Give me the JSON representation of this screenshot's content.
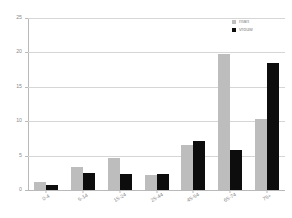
{
  "chart_data": {
    "type": "bar",
    "title": "",
    "subtitle": "",
    "xlabel": "",
    "ylabel": "",
    "categories": [
      "0-4",
      "5-14",
      "15-24",
      "25-44",
      "45-54",
      "65-74",
      "75+"
    ],
    "series": [
      {
        "name": "man",
        "color": "#bdbdbd",
        "values": [
          1.2,
          3.4,
          4.6,
          2.2,
          6.5,
          19.8,
          10.3
        ]
      },
      {
        "name": "vrouw",
        "color": "#0d0d0d",
        "values": [
          0.8,
          2.5,
          2.3,
          2.4,
          7.1,
          5.8,
          18.4
        ]
      }
    ],
    "ylim": [
      0,
      25
    ],
    "yticks": [
      0,
      5,
      10,
      15,
      20,
      25
    ],
    "ytick_labels": [
      "0",
      "5",
      "10",
      "15",
      "20",
      "25"
    ],
    "grid": true,
    "legend_position": "top-right"
  },
  "legend": {
    "items": [
      {
        "label": "man",
        "color": "#bdbdbd"
      },
      {
        "label": "vrouw",
        "color": "#0d0d0d"
      }
    ]
  },
  "axes": {
    "y_tick_labels": [
      "0",
      "5",
      "10",
      "15",
      "20",
      "25"
    ],
    "x_tick_labels": [
      "0-4",
      "5-14",
      "15-24",
      "25-44",
      "45-54",
      "65-74",
      "75+"
    ]
  },
  "colors": {
    "men": "#bdbdbd",
    "women": "#0d0d0d",
    "grid": "#d6d6d6",
    "axis": "#b9b9b9",
    "text": "#8a8a8a",
    "background": "#ffffff"
  }
}
